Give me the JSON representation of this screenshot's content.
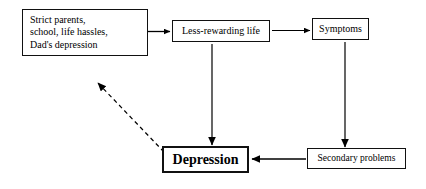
{
  "diagram": {
    "type": "flow-diagram",
    "background_color": "#ffffff",
    "line_color": "#000000",
    "nodes": [
      {
        "id": "causes",
        "label": "Strict parents,\nschool, life hassles,\nDad's depression",
        "emphasis": "normal"
      },
      {
        "id": "less_rewarding",
        "label": "Less-rewarding life",
        "emphasis": "normal"
      },
      {
        "id": "symptoms",
        "label": "Symptoms",
        "emphasis": "normal"
      },
      {
        "id": "depression",
        "label": "Depression",
        "emphasis": "bold"
      },
      {
        "id": "secondary",
        "label": "Secondary problems",
        "emphasis": "normal"
      }
    ],
    "edges": [
      {
        "id": "causes-to-less-rewarding",
        "from": "causes",
        "to": "less_rewarding",
        "style": "solid",
        "direction": "right"
      },
      {
        "id": "less-rewarding-to-symptoms",
        "from": "less_rewarding",
        "to": "symptoms",
        "style": "solid",
        "direction": "right"
      },
      {
        "id": "less-rewarding-to-depression",
        "from": "less_rewarding",
        "to": "depression",
        "style": "solid",
        "direction": "down"
      },
      {
        "id": "symptoms-to-secondary",
        "from": "symptoms",
        "to": "secondary",
        "style": "solid",
        "direction": "down"
      },
      {
        "id": "secondary-to-depression",
        "from": "secondary",
        "to": "depression",
        "style": "solid",
        "direction": "left"
      },
      {
        "id": "depression-to-causes",
        "from": "depression",
        "to": "causes",
        "style": "dashed",
        "direction": "up-left"
      }
    ]
  }
}
